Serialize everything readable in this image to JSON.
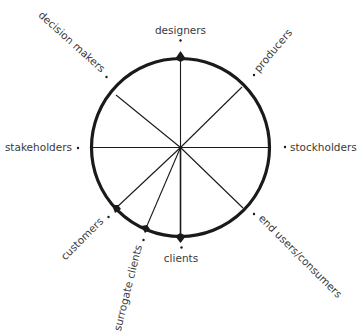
{
  "diagram": {
    "type": "stakeholder-wheel",
    "center": [
      180.5,
      147.5
    ],
    "radius": 89,
    "colors": {
      "stroke": "#1a1a1a",
      "text": "#3a3a3a",
      "background": "#ffffff"
    },
    "nodes": [
      {
        "id": "designers",
        "label": "designers"
      },
      {
        "id": "producers",
        "label": "producers"
      },
      {
        "id": "stockholders",
        "label": "stockholders"
      },
      {
        "id": "end-users",
        "label": "end users/consumers"
      },
      {
        "id": "clients",
        "label": "clients"
      },
      {
        "id": "surrogate-clients",
        "label": "surrogate clients"
      },
      {
        "id": "customers",
        "label": "customers"
      },
      {
        "id": "stakeholders",
        "label": "stakeholders"
      },
      {
        "id": "decision-makers",
        "label": "decision makers"
      }
    ]
  }
}
